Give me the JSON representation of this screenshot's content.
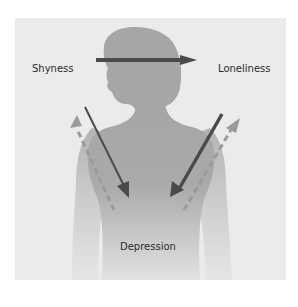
{
  "diagram": {
    "type": "concept-relationship",
    "nodes": [
      {
        "id": "shyness",
        "label": "Shyness"
      },
      {
        "id": "loneliness",
        "label": "Loneliness"
      },
      {
        "id": "depression",
        "label": "Depression"
      }
    ],
    "edges": [
      {
        "from": "shyness",
        "to": "loneliness",
        "style": "solid",
        "weight": "thick"
      },
      {
        "from": "shyness",
        "to": "depression",
        "style": "solid",
        "weight": "thin"
      },
      {
        "from": "depression",
        "to": "shyness",
        "style": "dashed"
      },
      {
        "from": "loneliness",
        "to": "depression",
        "style": "solid",
        "weight": "thick"
      },
      {
        "from": "depression",
        "to": "loneliness",
        "style": "dashed"
      }
    ],
    "background_figure": "silhouette-of-woman"
  },
  "labels": {
    "shyness": "Shyness",
    "loneliness": "Loneliness",
    "depression": "Depression"
  },
  "colors": {
    "panel": "#ebebeb",
    "silhouette": "#a9a9a9",
    "arrow_solid": "#4a4a4a",
    "arrow_dashed": "#9a9a9a",
    "text": "#2a2a2a"
  }
}
